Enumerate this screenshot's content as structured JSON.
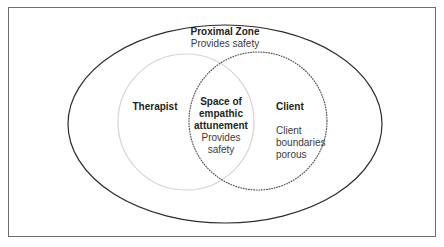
{
  "diagram": {
    "colors": {
      "frame": "#6d6d6d",
      "outer_ellipse": "#2b2b2b",
      "therapist_circle": "#d4d4d4",
      "client_circle": "#555555",
      "text": "#231f20"
    },
    "proximal_zone": {
      "title": "Proximal Zone",
      "subtitle": "Provides safety"
    },
    "therapist": {
      "title": "Therapist"
    },
    "overlap": {
      "title_line1": "Space of",
      "title_line2": "empathic",
      "title_line3": "attunement",
      "subtitle_line1": "Provides",
      "subtitle_line2": "safety"
    },
    "client": {
      "title": "Client",
      "subtitle_line1": "Client",
      "subtitle_line2": "boundaries",
      "subtitle_line3": "porous"
    }
  }
}
